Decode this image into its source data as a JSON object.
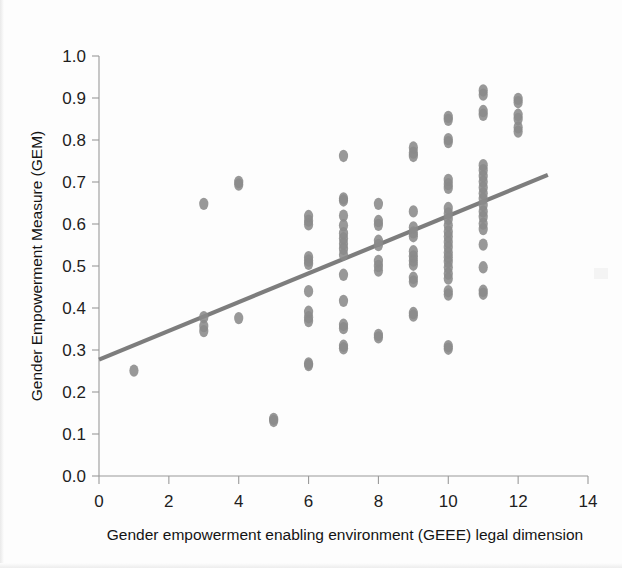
{
  "figure": {
    "background_color": "#fdfdfd",
    "point_color": "#8a8a8a",
    "line_color": "#7d7d7d",
    "axis_color": "#9a9a9a"
  },
  "axis_titles": {
    "x": "Gender empowerment enabling environment (GEEE) legal dimension",
    "y": "Gender Empowerment Measure (GEM)"
  },
  "chart_data": {
    "type": "scatter",
    "title": "",
    "xlabel": "Gender empowerment enabling environment (GEEE) legal dimension",
    "ylabel": "Gender Empowerment Measure (GEM)",
    "xlim": [
      0,
      14
    ],
    "ylim": [
      0.0,
      1.0
    ],
    "xticks": [
      0,
      2,
      4,
      6,
      8,
      10,
      12,
      14
    ],
    "yticks": [
      0.0,
      0.1,
      0.2,
      0.3,
      0.4,
      0.5,
      0.6,
      0.7,
      0.8,
      0.9,
      1.0
    ],
    "xtick_labels": [
      "0",
      "2",
      "4",
      "6",
      "8",
      "10",
      "12",
      "14"
    ],
    "ytick_labels": [
      "0.0",
      "0.1",
      "0.2",
      "0.3",
      "0.4",
      "0.5",
      "0.6",
      "0.7",
      "0.8",
      "0.9",
      "1.0"
    ],
    "grid": false,
    "legend": null,
    "marker": "circle",
    "marker_color": "#8a8a8a",
    "points": [
      [
        1.0,
        0.251
      ],
      [
        3.0,
        0.345
      ],
      [
        3.0,
        0.357
      ],
      [
        3.0,
        0.378
      ],
      [
        3.0,
        0.648
      ],
      [
        4.0,
        0.376
      ],
      [
        4.0,
        0.694
      ],
      [
        4.0,
        0.7
      ],
      [
        5.0,
        0.131
      ],
      [
        5.0,
        0.136
      ],
      [
        6.0,
        0.264
      ],
      [
        6.0,
        0.268
      ],
      [
        6.0,
        0.369
      ],
      [
        6.0,
        0.378
      ],
      [
        6.0,
        0.391
      ],
      [
        6.0,
        0.44
      ],
      [
        6.0,
        0.505
      ],
      [
        6.0,
        0.513
      ],
      [
        6.0,
        0.521
      ],
      [
        6.0,
        0.599
      ],
      [
        6.0,
        0.608
      ],
      [
        6.0,
        0.619
      ],
      [
        7.0,
        0.304
      ],
      [
        7.0,
        0.31
      ],
      [
        7.0,
        0.352
      ],
      [
        7.0,
        0.36
      ],
      [
        7.0,
        0.417
      ],
      [
        7.0,
        0.479
      ],
      [
        7.0,
        0.527
      ],
      [
        7.0,
        0.541
      ],
      [
        7.0,
        0.553
      ],
      [
        7.0,
        0.566
      ],
      [
        7.0,
        0.578
      ],
      [
        7.0,
        0.597
      ],
      [
        7.0,
        0.62
      ],
      [
        7.0,
        0.656
      ],
      [
        7.0,
        0.661
      ],
      [
        7.0,
        0.762
      ],
      [
        8.0,
        0.33
      ],
      [
        8.0,
        0.336
      ],
      [
        8.0,
        0.489
      ],
      [
        8.0,
        0.5
      ],
      [
        8.0,
        0.512
      ],
      [
        8.0,
        0.55
      ],
      [
        8.0,
        0.56
      ],
      [
        8.0,
        0.598
      ],
      [
        8.0,
        0.607
      ],
      [
        8.0,
        0.648
      ],
      [
        9.0,
        0.382
      ],
      [
        9.0,
        0.388
      ],
      [
        9.0,
        0.463
      ],
      [
        9.0,
        0.472
      ],
      [
        9.0,
        0.503
      ],
      [
        9.0,
        0.513
      ],
      [
        9.0,
        0.523
      ],
      [
        9.0,
        0.535
      ],
      [
        9.0,
        0.571
      ],
      [
        9.0,
        0.58
      ],
      [
        9.0,
        0.592
      ],
      [
        9.0,
        0.63
      ],
      [
        9.0,
        0.762
      ],
      [
        9.0,
        0.77
      ],
      [
        9.0,
        0.782
      ],
      [
        10.0,
        0.303
      ],
      [
        10.0,
        0.309
      ],
      [
        10.0,
        0.432
      ],
      [
        10.0,
        0.44
      ],
      [
        10.0,
        0.47
      ],
      [
        10.0,
        0.482
      ],
      [
        10.0,
        0.497
      ],
      [
        10.0,
        0.51
      ],
      [
        10.0,
        0.521
      ],
      [
        10.0,
        0.532
      ],
      [
        10.0,
        0.545
      ],
      [
        10.0,
        0.557
      ],
      [
        10.0,
        0.57
      ],
      [
        10.0,
        0.582
      ],
      [
        10.0,
        0.597
      ],
      [
        10.0,
        0.612
      ],
      [
        10.0,
        0.625
      ],
      [
        10.0,
        0.638
      ],
      [
        10.0,
        0.686
      ],
      [
        10.0,
        0.695
      ],
      [
        10.0,
        0.705
      ],
      [
        10.0,
        0.795
      ],
      [
        10.0,
        0.802
      ],
      [
        10.0,
        0.848
      ],
      [
        10.0,
        0.855
      ],
      [
        11.0,
        0.434
      ],
      [
        11.0,
        0.441
      ],
      [
        11.0,
        0.497
      ],
      [
        11.0,
        0.551
      ],
      [
        11.0,
        0.588
      ],
      [
        11.0,
        0.601
      ],
      [
        11.0,
        0.617
      ],
      [
        11.0,
        0.63
      ],
      [
        11.0,
        0.645
      ],
      [
        11.0,
        0.66
      ],
      [
        11.0,
        0.673
      ],
      [
        11.0,
        0.687
      ],
      [
        11.0,
        0.701
      ],
      [
        11.0,
        0.714
      ],
      [
        11.0,
        0.728
      ],
      [
        11.0,
        0.74
      ],
      [
        11.0,
        0.86
      ],
      [
        11.0,
        0.869
      ],
      [
        11.0,
        0.908
      ],
      [
        11.0,
        0.918
      ],
      [
        12.0,
        0.82
      ],
      [
        12.0,
        0.83
      ],
      [
        12.0,
        0.85
      ],
      [
        12.0,
        0.86
      ],
      [
        12.0,
        0.89
      ],
      [
        12.0,
        0.898
      ]
    ],
    "trend_line": {
      "x_start": 0.0,
      "y_start": 0.277,
      "x_end": 12.85,
      "y_end": 0.717,
      "color": "#7d7d7d",
      "width": 4.2
    }
  }
}
